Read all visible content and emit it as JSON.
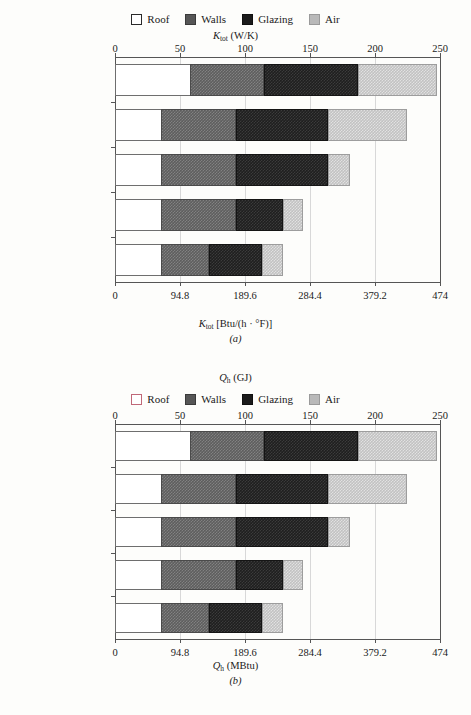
{
  "chart_data": [
    {
      "type": "bar",
      "orientation": "horizontal",
      "stacked": true,
      "panel": "(a)",
      "title": "",
      "top_axis": {
        "label_html": "K_tot (W/K)",
        "label_base": "K",
        "label_sub": "tot",
        "label_unit": "(W/K)",
        "ticks": [
          0,
          50,
          100,
          150,
          200,
          250
        ],
        "tick_labels": [
          "0",
          "50",
          "100",
          "150",
          "200",
          "250"
        ],
        "range": [
          0,
          250
        ]
      },
      "bottom_axis": {
        "label_base": "K",
        "label_sub": "tot",
        "label_unit": "[Btu/(h · °F)]",
        "ticks": [
          0,
          94.8,
          189.6,
          284.4,
          379.2,
          474
        ],
        "tick_labels": [
          "0",
          "94.8",
          "189.6",
          "284.4",
          "379.2",
          "474"
        ],
        "range": [
          0,
          474
        ]
      },
      "categories": [
        "Reference",
        "Add roof insulation",
        "Add HX",
        "Low-U glazing",
        "Add wall insulation"
      ],
      "series": [
        {
          "name": "Roof",
          "values": [
            58,
            35,
            35,
            35,
            35
          ]
        },
        {
          "name": "Walls",
          "values": [
            57,
            58,
            58,
            58,
            37
          ]
        },
        {
          "name": "Glazing",
          "values": [
            72,
            71,
            71,
            36,
            41
          ]
        },
        {
          "name": "Air",
          "values": [
            61,
            61,
            17,
            16,
            16
          ]
        }
      ],
      "totals": [
        248,
        225,
        181,
        145,
        129
      ],
      "legend": [
        "Roof",
        "Walls",
        "Glazing",
        "Air"
      ],
      "legend_position": "top",
      "grid": true
    },
    {
      "type": "bar",
      "orientation": "horizontal",
      "stacked": true,
      "panel": "(b)",
      "heading_base": "Q",
      "heading_sub": "h",
      "heading_unit": "(GJ)",
      "top_axis": {
        "label_base": "Q",
        "label_sub": "h",
        "label_unit": "(GJ)",
        "ticks": [
          0,
          50,
          100,
          150,
          200,
          250
        ],
        "tick_labels": [
          "0",
          "50",
          "100",
          "150",
          "200",
          "250"
        ],
        "range": [
          0,
          250
        ]
      },
      "bottom_axis": {
        "label_base": "Q",
        "label_sub": "h",
        "label_unit": "(MBtu)",
        "ticks": [
          0,
          94.8,
          189.6,
          284.4,
          379.2,
          474
        ],
        "tick_labels": [
          "0",
          "94.8",
          "189.6",
          "284.4",
          "379.2",
          "474"
        ],
        "range": [
          0,
          474
        ]
      },
      "categories": [
        "Reference",
        "Add roof insulation",
        "Add HX",
        "Low-U glazing",
        "Add wall insulation"
      ],
      "series": [
        {
          "name": "Roof",
          "values": [
            58,
            35,
            35,
            35,
            35
          ]
        },
        {
          "name": "Walls",
          "values": [
            57,
            58,
            58,
            58,
            37
          ]
        },
        {
          "name": "Glazing",
          "values": [
            72,
            71,
            71,
            36,
            41
          ]
        },
        {
          "name": "Air",
          "values": [
            61,
            61,
            17,
            16,
            16
          ]
        }
      ],
      "totals": [
        248,
        225,
        181,
        145,
        129
      ],
      "legend": [
        "Roof",
        "Walls",
        "Glazing",
        "Air"
      ],
      "legend_position": "top",
      "grid": true
    }
  ],
  "panel_a": {
    "legend": {
      "roof": "Roof",
      "walls": "Walls",
      "glazing": "Glazing",
      "air": "Air"
    },
    "top_title": {
      "base": "K",
      "sub": "tot",
      "unit": "(W/K)"
    },
    "bottom_title": {
      "base": "K",
      "sub": "tot",
      "unit": "[Btu/(h · °F)]"
    },
    "letter": "(a)",
    "top_ticks": [
      "0",
      "50",
      "100",
      "150",
      "200",
      "250"
    ],
    "bottom_ticks": [
      "0",
      "94.8",
      "189.6",
      "284.4",
      "379.2",
      "474"
    ],
    "categories": [
      "Reference",
      "Add roof insulation",
      "Add HX",
      "Low-U glazing",
      "Add wall insulation"
    ]
  },
  "panel_b": {
    "heading": {
      "base": "Q",
      "sub": "h",
      "unit": "(GJ)"
    },
    "legend": {
      "roof": "Roof",
      "walls": "Walls",
      "glazing": "Glazing",
      "air": "Air"
    },
    "bottom_title": {
      "base": "Q",
      "sub": "h",
      "unit": "(MBtu)"
    },
    "letter": "(b)",
    "top_ticks": [
      "0",
      "50",
      "100",
      "150",
      "200",
      "250"
    ],
    "bottom_ticks": [
      "0",
      "94.8",
      "189.6",
      "284.4",
      "379.2",
      "474"
    ],
    "categories": [
      "Reference",
      "Add roof insulation",
      "Add HX",
      "Low-U glazing",
      "Add wall insulation"
    ]
  },
  "colors": {
    "roof": "#ffffff",
    "walls": "#5e5e5e",
    "glazing": "#1f1f1f",
    "air": "#c2c2c2",
    "axis": "#555555",
    "grid": "#d8d8d8",
    "roof_border_b": "#c06878"
  }
}
